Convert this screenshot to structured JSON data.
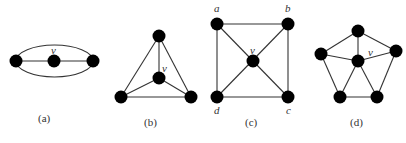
{
  "figures": [
    {
      "id": "a",
      "caption": "(a)",
      "center_label": "v",
      "nodes": [
        [
          16,
          61
        ],
        [
          54,
          61
        ],
        [
          93,
          61
        ]
      ],
      "description": "Three collinear vertices joined by a straight line, enclosed by an ellipse through the outer vertices"
    },
    {
      "id": "b",
      "caption": "(b)",
      "center_label": "v",
      "nodes": [
        [
          159,
          36
        ],
        [
          159,
          78
        ],
        [
          121,
          97
        ],
        [
          191,
          97
        ]
      ],
      "description": "Triangle with central vertex v joined to all three corners (K4)"
    },
    {
      "id": "c",
      "caption": "(c)",
      "center_label": "v",
      "corner_labels": {
        "a": "a",
        "b": "b",
        "c": "c",
        "d": "d"
      },
      "nodes": [
        [
          217,
          24
        ],
        [
          288,
          24
        ],
        [
          253,
          62
        ],
        [
          217,
          97
        ],
        [
          288,
          97
        ]
      ],
      "description": "Square a-b-c-d with diagonals meeting at central vertex v (wheel W4)"
    },
    {
      "id": "d",
      "caption": "(d)",
      "center_label": "v",
      "nodes": [
        [
          358,
          31
        ],
        [
          321,
          54
        ],
        [
          396,
          51
        ],
        [
          358,
          61
        ],
        [
          340,
          97
        ],
        [
          377,
          97
        ]
      ],
      "description": "Pentagon with central vertex v joined to all five outer vertices (wheel W5)"
    }
  ]
}
